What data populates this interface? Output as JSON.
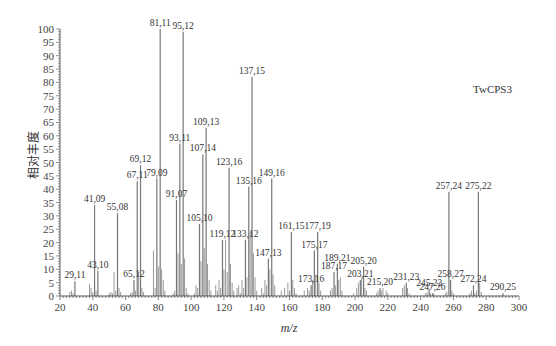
{
  "chart_data": {
    "type": "bar",
    "title": "",
    "annotation": "TwCPS3",
    "xlabel": "m/z",
    "ylabel": "相对丰度",
    "xlim": [
      20,
      300
    ],
    "ylim": [
      0,
      100
    ],
    "x_ticks": [
      20,
      40,
      60,
      80,
      100,
      120,
      140,
      160,
      180,
      200,
      220,
      240,
      260,
      280,
      300
    ],
    "y_ticks": [
      0,
      5,
      10,
      15,
      20,
      25,
      30,
      35,
      40,
      45,
      50,
      55,
      60,
      65,
      70,
      75,
      80,
      85,
      90,
      95,
      100
    ],
    "grid": false,
    "legend": null,
    "labeled_peaks": [
      {
        "mz": 29.11,
        "label": "29,11",
        "intensity": 5.5
      },
      {
        "mz": 41.09,
        "label": "41,09",
        "intensity": 34
      },
      {
        "mz": 43.1,
        "label": "43,10",
        "intensity": 9.5
      },
      {
        "mz": 55.08,
        "label": "55,08",
        "intensity": 31
      },
      {
        "mz": 65.12,
        "label": "65,12",
        "intensity": 6
      },
      {
        "mz": 67.11,
        "label": "67,11",
        "intensity": 43
      },
      {
        "mz": 69.12,
        "label": "69,12",
        "intensity": 49
      },
      {
        "mz": 79.09,
        "label": "79,09",
        "intensity": 44
      },
      {
        "mz": 81.11,
        "label": "81,11",
        "intensity": 100
      },
      {
        "mz": 91.07,
        "label": "91,07",
        "intensity": 36
      },
      {
        "mz": 93.11,
        "label": "93,11",
        "intensity": 57
      },
      {
        "mz": 95.12,
        "label": "95,12",
        "intensity": 99
      },
      {
        "mz": 105.1,
        "label": "105,10",
        "intensity": 27
      },
      {
        "mz": 107.14,
        "label": "107,14",
        "intensity": 53
      },
      {
        "mz": 109.13,
        "label": "109,13",
        "intensity": 63
      },
      {
        "mz": 119.12,
        "label": "119,12",
        "intensity": 21
      },
      {
        "mz": 123.16,
        "label": "123,16",
        "intensity": 48
      },
      {
        "mz": 133.12,
        "label": "133,12",
        "intensity": 21
      },
      {
        "mz": 135.16,
        "label": "135,16",
        "intensity": 41
      },
      {
        "mz": 137.15,
        "label": "137,15",
        "intensity": 82
      },
      {
        "mz": 147.13,
        "label": "147,13",
        "intensity": 14
      },
      {
        "mz": 149.16,
        "label": "149,16",
        "intensity": 44
      },
      {
        "mz": 161.15,
        "label": "161,15",
        "intensity": 24
      },
      {
        "mz": 173.16,
        "label": "173,16",
        "intensity": 4
      },
      {
        "mz": 175.17,
        "label": "175,17",
        "intensity": 17
      },
      {
        "mz": 177.19,
        "label": "177,19",
        "intensity": 24
      },
      {
        "mz": 187.17,
        "label": "187,17",
        "intensity": 9
      },
      {
        "mz": 189.21,
        "label": "189,21",
        "intensity": 12
      },
      {
        "mz": 203.21,
        "label": "203,21",
        "intensity": 6
      },
      {
        "mz": 205.2,
        "label": "205,20",
        "intensity": 11
      },
      {
        "mz": 215.2,
        "label": "215,20",
        "intensity": 3
      },
      {
        "mz": 231.23,
        "label": "231,23",
        "intensity": 5
      },
      {
        "mz": 245.23,
        "label": "245,23",
        "intensity": 2.5
      },
      {
        "mz": 247.26,
        "label": "247,26",
        "intensity": 1
      },
      {
        "mz": 257.24,
        "label": "257,24",
        "intensity": 39
      },
      {
        "mz": 258.27,
        "label": "258,27",
        "intensity": 6
      },
      {
        "mz": 272.24,
        "label": "272,24",
        "intensity": 4
      },
      {
        "mz": 275.22,
        "label": "275,22",
        "intensity": 39
      },
      {
        "mz": 290.25,
        "label": "290,25",
        "intensity": 1
      }
    ],
    "minor_peaks": [
      [
        26,
        1.5
      ],
      [
        27,
        2
      ],
      [
        28,
        1
      ],
      [
        38,
        4.5
      ],
      [
        39,
        3
      ],
      [
        40,
        1.5
      ],
      [
        42,
        2
      ],
      [
        50,
        1
      ],
      [
        51,
        1.5
      ],
      [
        52,
        1
      ],
      [
        53,
        9
      ],
      [
        54,
        2
      ],
      [
        56,
        3
      ],
      [
        57,
        1.5
      ],
      [
        63,
        1
      ],
      [
        64,
        1.5
      ],
      [
        66,
        2
      ],
      [
        68,
        9
      ],
      [
        70,
        3
      ],
      [
        71,
        1.5
      ],
      [
        77,
        17
      ],
      [
        78,
        3
      ],
      [
        80,
        11
      ],
      [
        82,
        10
      ],
      [
        83,
        6
      ],
      [
        84,
        2
      ],
      [
        89,
        1
      ],
      [
        90,
        2
      ],
      [
        92,
        16
      ],
      [
        94,
        12
      ],
      [
        96,
        14
      ],
      [
        97,
        3
      ],
      [
        98,
        1
      ],
      [
        102,
        1
      ],
      [
        103,
        4
      ],
      [
        104,
        3
      ],
      [
        106,
        13
      ],
      [
        108,
        18
      ],
      [
        110,
        12
      ],
      [
        111,
        6
      ],
      [
        112,
        2
      ],
      [
        115,
        4
      ],
      [
        116,
        2
      ],
      [
        117,
        6
      ],
      [
        118,
        3
      ],
      [
        120,
        10
      ],
      [
        121,
        21
      ],
      [
        122,
        9
      ],
      [
        124,
        12
      ],
      [
        125,
        5
      ],
      [
        126,
        2
      ],
      [
        128,
        3
      ],
      [
        129,
        4
      ],
      [
        130,
        1
      ],
      [
        131,
        6
      ],
      [
        132,
        3
      ],
      [
        134,
        7
      ],
      [
        136,
        24
      ],
      [
        138,
        16
      ],
      [
        139,
        7
      ],
      [
        140,
        2
      ],
      [
        143,
        3
      ],
      [
        144,
        1
      ],
      [
        145,
        6
      ],
      [
        146,
        4
      ],
      [
        148,
        10
      ],
      [
        150,
        8
      ],
      [
        151,
        4
      ],
      [
        155,
        2
      ],
      [
        157,
        3
      ],
      [
        159,
        5
      ],
      [
        160,
        2
      ],
      [
        162,
        6
      ],
      [
        163,
        3
      ],
      [
        164,
        1
      ],
      [
        169,
        2
      ],
      [
        171,
        3
      ],
      [
        172,
        2
      ],
      [
        174,
        6
      ],
      [
        176,
        8
      ],
      [
        178,
        5
      ],
      [
        179,
        2
      ],
      [
        185,
        2
      ],
      [
        186,
        3
      ],
      [
        188,
        4
      ],
      [
        190,
        6
      ],
      [
        191,
        7
      ],
      [
        192,
        2
      ],
      [
        199,
        1
      ],
      [
        201,
        3
      ],
      [
        202,
        5
      ],
      [
        204,
        7
      ],
      [
        206,
        3
      ],
      [
        207,
        2
      ],
      [
        213,
        1
      ],
      [
        214,
        2
      ],
      [
        216,
        2
      ],
      [
        217,
        3
      ],
      [
        219,
        2
      ],
      [
        220,
        1
      ],
      [
        229,
        3
      ],
      [
        230,
        4
      ],
      [
        232,
        3
      ],
      [
        233,
        1
      ],
      [
        243,
        1
      ],
      [
        244,
        1.5
      ],
      [
        246,
        1
      ],
      [
        248,
        1
      ],
      [
        255,
        1
      ],
      [
        256,
        1.5
      ],
      [
        259,
        2
      ],
      [
        260,
        1
      ],
      [
        270,
        1
      ],
      [
        271,
        2
      ],
      [
        273,
        1
      ],
      [
        274,
        2
      ],
      [
        276,
        5
      ],
      [
        277,
        1.5
      ]
    ]
  }
}
